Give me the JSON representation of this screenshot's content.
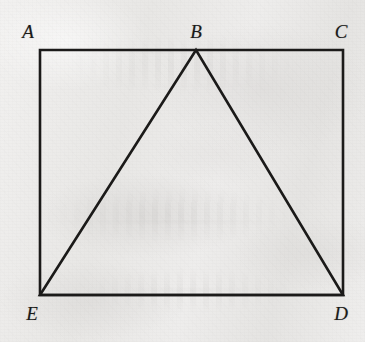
{
  "figure": {
    "kind": "geometry-diagram",
    "canvas": {
      "width": 365,
      "height": 342
    },
    "colors": {
      "ink": "#1b1a19",
      "paper": "#ececeb",
      "label_ink": "#1b1a19"
    },
    "stroke_width": 2.6,
    "points": {
      "A": {
        "x": 40,
        "y": 50,
        "label": "A",
        "label_x": 28,
        "label_y": 31
      },
      "B": {
        "x": 196,
        "y": 50,
        "label": "B",
        "label_x": 196,
        "label_y": 31
      },
      "C": {
        "x": 343,
        "y": 50,
        "label": "C",
        "label_x": 341,
        "label_y": 31
      },
      "D": {
        "x": 343,
        "y": 295,
        "label": "D",
        "label_x": 341,
        "label_y": 313
      },
      "E": {
        "x": 40,
        "y": 295,
        "label": "E",
        "label_x": 32,
        "label_y": 313
      }
    },
    "shapes": [
      {
        "name": "rectangle-ACDE",
        "type": "polygon",
        "vertices": [
          "A",
          "C",
          "D",
          "E"
        ],
        "closed": true
      },
      {
        "name": "triangle-BED",
        "type": "polygon",
        "vertices": [
          "B",
          "E",
          "D"
        ],
        "closed": true
      }
    ],
    "segments": [
      {
        "name": "segment-AC",
        "from": "A",
        "to": "C"
      },
      {
        "name": "segment-CD",
        "from": "C",
        "to": "D"
      },
      {
        "name": "segment-DE",
        "from": "D",
        "to": "E"
      },
      {
        "name": "segment-EA",
        "from": "E",
        "to": "A"
      },
      {
        "name": "segment-BE",
        "from": "B",
        "to": "E"
      },
      {
        "name": "segment-BD",
        "from": "B",
        "to": "D"
      }
    ],
    "labels": [
      {
        "id": "A",
        "text": "A"
      },
      {
        "id": "B",
        "text": "B"
      },
      {
        "id": "C",
        "text": "C"
      },
      {
        "id": "D",
        "text": "D"
      },
      {
        "id": "E",
        "text": "E"
      }
    ]
  }
}
